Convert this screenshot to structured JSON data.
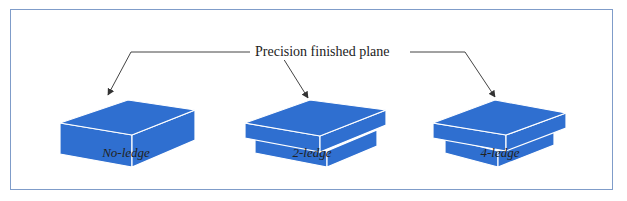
{
  "figure": {
    "callout_label": "Precision finished plane",
    "items": [
      {
        "id": "no-ledge",
        "caption": "No-ledge"
      },
      {
        "id": "2-ledge",
        "caption": "2-ledge"
      },
      {
        "id": "4-ledge",
        "caption": "4-ledge"
      }
    ],
    "colors": {
      "block_fill": "#2f6fd0",
      "block_edge": "#ffffff",
      "frame_border": "#7f9cc9",
      "arrow": "#333333"
    }
  }
}
